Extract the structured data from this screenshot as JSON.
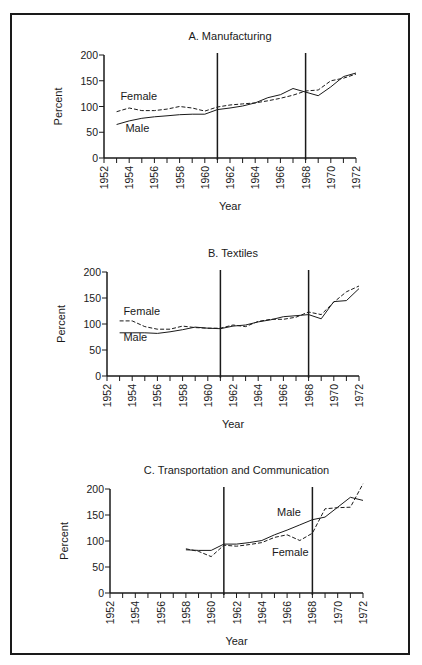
{
  "chart_data": [
    {
      "type": "line",
      "title": "A. Manufacturing",
      "xlabel": "Year",
      "ylabel": "Percent",
      "ylim": [
        0,
        200
      ],
      "xlim": [
        1952,
        1972
      ],
      "yticks": [
        0,
        50,
        100,
        150,
        200
      ],
      "xticks": [
        1952,
        1954,
        1956,
        1958,
        1960,
        1962,
        1964,
        1966,
        1968,
        1970,
        1972
      ],
      "vertical_lines": [
        1961,
        1968
      ],
      "grid": false,
      "series": [
        {
          "name": "Female",
          "style": "dashed",
          "x": [
            1953,
            1954,
            1955,
            1956,
            1957,
            1958,
            1959,
            1960,
            1961,
            1962,
            1963,
            1964,
            1965,
            1966,
            1967,
            1968,
            1969,
            1970,
            1971,
            1972
          ],
          "values": [
            90,
            97,
            92,
            92,
            95,
            100,
            97,
            91,
            99,
            103,
            105,
            107,
            111,
            116,
            122,
            130,
            132,
            150,
            155,
            163
          ]
        },
        {
          "name": "Male",
          "style": "solid",
          "x": [
            1953,
            1954,
            1955,
            1956,
            1957,
            1958,
            1959,
            1960,
            1961,
            1962,
            1963,
            1964,
            1965,
            1966,
            1967,
            1968,
            1969,
            1970,
            1971,
            1972
          ],
          "values": [
            65,
            72,
            77,
            80,
            82,
            84,
            85,
            85,
            94,
            97,
            101,
            107,
            117,
            123,
            135,
            128,
            121,
            138,
            158,
            165
          ]
        }
      ],
      "annotations": [
        {
          "text": "Female",
          "x": 1953.3,
          "y": 113
        },
        {
          "text": "Male",
          "x": 1953.7,
          "y": 50
        }
      ]
    },
    {
      "type": "line",
      "title": "B. Textiles",
      "xlabel": "Year",
      "ylabel": "Percent",
      "ylim": [
        0,
        200
      ],
      "xlim": [
        1952,
        1972
      ],
      "yticks": [
        0,
        50,
        100,
        150,
        200
      ],
      "xticks": [
        1952,
        1954,
        1956,
        1958,
        1960,
        1962,
        1964,
        1966,
        1968,
        1970,
        1972
      ],
      "vertical_lines": [
        1961,
        1968
      ],
      "grid": false,
      "series": [
        {
          "name": "Female",
          "style": "dashed",
          "x": [
            1953,
            1954,
            1955,
            1956,
            1957,
            1958,
            1959,
            1960,
            1961,
            1962,
            1963,
            1964,
            1965,
            1966,
            1967,
            1968,
            1969,
            1970,
            1971,
            1972
          ],
          "values": [
            106,
            106,
            95,
            90,
            90,
            96,
            93,
            92,
            92,
            98,
            95,
            105,
            109,
            109,
            113,
            123,
            118,
            142,
            162,
            173
          ]
        },
        {
          "name": "Male",
          "style": "solid",
          "x": [
            1953,
            1954,
            1955,
            1956,
            1957,
            1958,
            1959,
            1960,
            1961,
            1962,
            1963,
            1964,
            1965,
            1966,
            1967,
            1968,
            1969,
            1970,
            1971,
            1972
          ],
          "values": [
            83,
            83,
            83,
            82,
            85,
            89,
            94,
            92,
            91,
            96,
            98,
            104,
            108,
            114,
            116,
            118,
            110,
            143,
            145,
            168
          ]
        }
      ],
      "annotations": [
        {
          "text": "Female",
          "x": 1953.3,
          "y": 118
        },
        {
          "text": "Male",
          "x": 1953.3,
          "y": 68
        }
      ]
    },
    {
      "type": "line",
      "title": "C. Transportation and Communication",
      "xlabel": "Year",
      "ylabel": "Percent",
      "ylim": [
        0,
        200
      ],
      "xlim": [
        1952,
        1972
      ],
      "yticks": [
        0,
        50,
        100,
        150,
        200
      ],
      "xticks": [
        1952,
        1954,
        1956,
        1958,
        1960,
        1962,
        1964,
        1966,
        1968,
        1970,
        1972
      ],
      "vertical_lines": [
        1961,
        1968
      ],
      "grid": false,
      "series": [
        {
          "name": "Male",
          "style": "solid",
          "x": [
            1958,
            1959,
            1960,
            1961,
            1962,
            1963,
            1964,
            1965,
            1966,
            1967,
            1968,
            1969,
            1970,
            1971,
            1972
          ],
          "values": [
            83,
            82,
            82,
            94,
            94,
            97,
            101,
            112,
            121,
            131,
            141,
            146,
            165,
            184,
            178
          ]
        },
        {
          "name": "Female",
          "style": "dashed",
          "x": [
            1958,
            1959,
            1960,
            1961,
            1962,
            1963,
            1964,
            1965,
            1966,
            1967,
            1968,
            1969,
            1970,
            1971,
            1972
          ],
          "values": [
            85,
            80,
            70,
            92,
            90,
            93,
            97,
            107,
            112,
            101,
            115,
            162,
            164,
            165,
            210
          ]
        }
      ],
      "annotations": [
        {
          "text": "Male",
          "x": 1965.2,
          "y": 148
        },
        {
          "text": "Female",
          "x": 1964.8,
          "y": 72
        }
      ]
    }
  ]
}
